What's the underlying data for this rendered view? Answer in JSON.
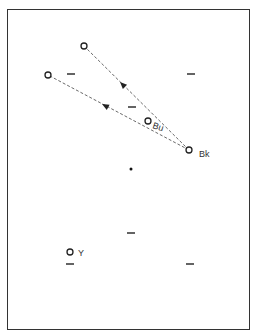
{
  "diagram": {
    "type": "point-movement-diagram",
    "frame": {
      "x": 7,
      "y": 9,
      "w": 243,
      "h": 321
    },
    "colors": {
      "stroke": "#333333",
      "background": "#ffffff"
    },
    "points": [
      {
        "id": "top",
        "x": 84,
        "y": 46,
        "label": ""
      },
      {
        "id": "left",
        "x": 48,
        "y": 75,
        "label": ""
      },
      {
        "id": "bu",
        "x": 148,
        "y": 121,
        "label": "Bu"
      },
      {
        "id": "bk",
        "x": 189,
        "y": 150,
        "label": "Bk"
      },
      {
        "id": "y",
        "x": 70,
        "y": 252,
        "label": "Y"
      }
    ],
    "center_dot": {
      "x": 131,
      "y": 169
    },
    "dashes": [
      {
        "x": 71,
        "y": 74
      },
      {
        "x": 191,
        "y": 74
      },
      {
        "x": 132,
        "y": 107
      },
      {
        "x": 131,
        "y": 233
      },
      {
        "x": 70,
        "y": 264
      },
      {
        "x": 190,
        "y": 264
      }
    ],
    "arrows": [
      {
        "from": "bk",
        "to": "top",
        "style": "dashed"
      },
      {
        "from": "bk",
        "to": "left",
        "style": "dashed"
      }
    ],
    "labels": {
      "bu": "Bu",
      "bk": "Bk",
      "y": "Y"
    }
  }
}
